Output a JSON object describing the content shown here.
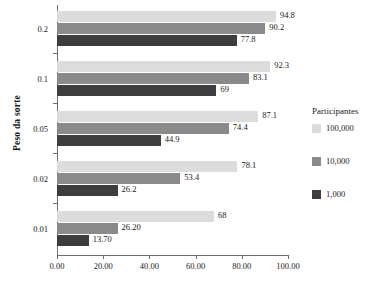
{
  "chart_data": {
    "type": "bar",
    "orientation": "horizontal",
    "title": "",
    "xlabel": "",
    "ylabel": "Peso da sorte",
    "categories": [
      "0.2",
      "0.1",
      "0.05",
      "0.02",
      "0.01"
    ],
    "xlim": [
      0,
      100
    ],
    "xticks": [
      0,
      20,
      40,
      60,
      80,
      100
    ],
    "xtick_labels": [
      "0.00",
      "20.00",
      "40.00",
      "60.00",
      "80.00",
      "100.00"
    ],
    "grid": false,
    "legend_position": "right",
    "legend_title": "Participantes",
    "series": [
      {
        "name": "100,000",
        "color": "#dcdcdc",
        "values": [
          94.8,
          92.3,
          87.1,
          78.1,
          68
        ],
        "labels": [
          "94.8",
          "92.3",
          "87.1",
          "78.1",
          "68"
        ]
      },
      {
        "name": "10,000",
        "color": "#8a8a8a",
        "values": [
          90.2,
          83.1,
          74.4,
          53.4,
          26.2
        ],
        "labels": [
          "90.2",
          "83.1",
          "74.4",
          "53.4",
          "26.20"
        ]
      },
      {
        "name": "1,000",
        "color": "#3d3d3d",
        "values": [
          77.8,
          69,
          44.9,
          26.2,
          13.7
        ],
        "labels": [
          "77.8",
          "69",
          "44.9",
          "26.2",
          "13.70"
        ]
      }
    ]
  },
  "axis": {
    "y_title": "Peso da sorte",
    "y_labels": [
      "0.2",
      "0.1",
      "0.05",
      "0.02",
      "0.01"
    ],
    "x_labels": [
      "0.00",
      "20.00",
      "40.00",
      "60.00",
      "80.00",
      "100.00"
    ]
  },
  "legend": {
    "title": "Participantes",
    "items": [
      {
        "label": "100,000",
        "color": "#dcdcdc"
      },
      {
        "label": "10,000",
        "color": "#8a8a8a"
      },
      {
        "label": "1,000",
        "color": "#3d3d3d"
      }
    ]
  },
  "colors": {
    "series_100k": "#dcdcdc",
    "series_10k": "#8a8a8a",
    "series_1k": "#3d3d3d",
    "axis": "#6e6e6e",
    "text": "#1a1a1a",
    "background": "#ffffff"
  }
}
